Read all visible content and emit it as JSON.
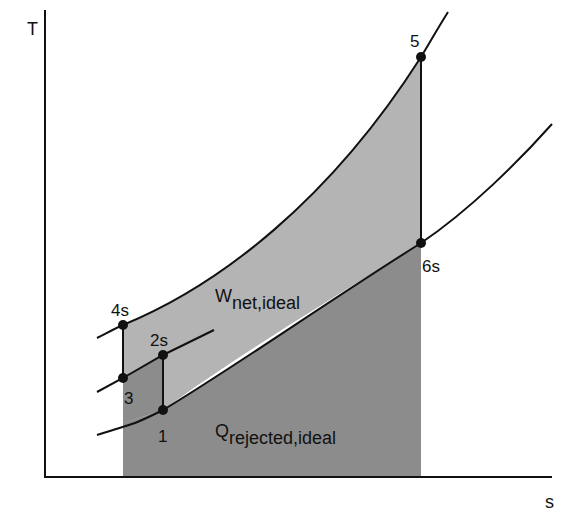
{
  "diagram": {
    "axes": {
      "y_label": "T",
      "x_label": "s"
    },
    "states": [
      {
        "id": "1",
        "label": "1"
      },
      {
        "id": "2s",
        "label": "2s"
      },
      {
        "id": "3",
        "label": "3"
      },
      {
        "id": "4s",
        "label": "4s"
      },
      {
        "id": "5",
        "label": "5"
      },
      {
        "id": "6s",
        "label": "6s"
      }
    ],
    "regions": {
      "work": {
        "main": "W",
        "sub": "net,ideal"
      },
      "heat_rejected": {
        "main": "Q",
        "sub": "rejected,ideal"
      }
    },
    "colors": {
      "light_fill": "#b4b4b4",
      "dark_fill": "#8c8c8c",
      "line": "#111111"
    }
  }
}
